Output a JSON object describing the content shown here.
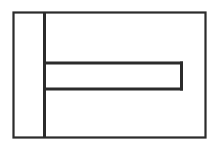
{
  "figure": {
    "title": "",
    "background_color": "#ffffff",
    "stroke_color": "#2b2b2b",
    "width": 220,
    "height": 149
  },
  "shapes": {
    "outer_rectangle": {
      "name": "outer-body-outline",
      "x": 13.5,
      "y": 12.5,
      "width": 192,
      "height": 125,
      "stroke_width": 2.2
    },
    "vertical_divider": {
      "name": "vertical-divider-line",
      "x1": 44.5,
      "y1": 12.5,
      "x2": 44.5,
      "y2": 137.5,
      "stroke_width": 3
    },
    "slot_rectangle": {
      "name": "horizontal-slot-outline",
      "x1": 44.5,
      "y1": 63,
      "x2": 183,
      "y2": 89,
      "stroke_width": 3
    }
  },
  "labels": {
    "dimensions": [],
    "annotations": []
  }
}
